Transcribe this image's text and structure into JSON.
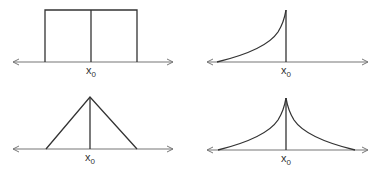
{
  "panels": [
    {
      "id": "rectangular",
      "shape": "rect",
      "label": "x",
      "sub": "0"
    },
    {
      "id": "one-sided-exponential",
      "shape": "left-exp",
      "label": "x",
      "sub": "0"
    },
    {
      "id": "triangular",
      "shape": "triangle",
      "label": "x",
      "sub": "0"
    },
    {
      "id": "double-exponential",
      "shape": "two-sided-exp",
      "label": "x",
      "sub": "0"
    }
  ],
  "colors": {
    "curve": "#333333",
    "axis": "#777777",
    "background": "#ffffff"
  }
}
